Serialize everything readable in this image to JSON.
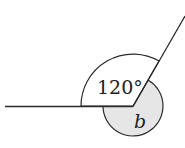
{
  "diagram": {
    "type": "angle-diagram",
    "angles": [
      {
        "label": "120°",
        "value_degrees": 120
      },
      {
        "label": "b",
        "shaded": true
      }
    ],
    "colors": {
      "stroke": "#2a2a2a",
      "shade": "#e6e6e6",
      "background": "#ffffff"
    }
  }
}
